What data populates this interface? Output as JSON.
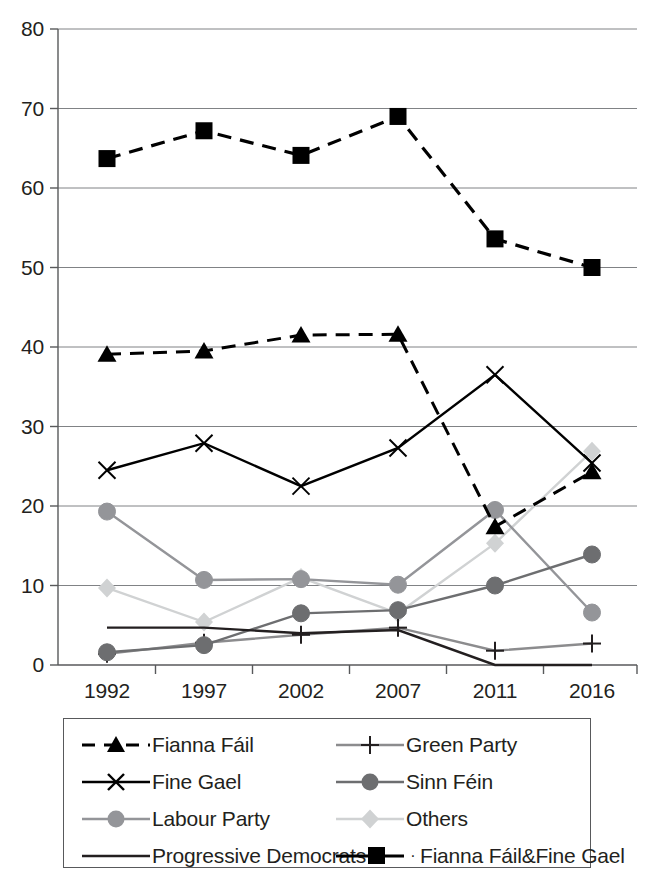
{
  "chart_data": {
    "type": "line",
    "title": "",
    "xlabel": "",
    "ylabel": "",
    "categories": [
      "1992",
      "1997",
      "2002",
      "2007",
      "2011",
      "2016"
    ],
    "ylim": [
      0,
      80
    ],
    "yticks": [
      0,
      10,
      20,
      30,
      40,
      50,
      60,
      70,
      80
    ],
    "grid": true,
    "legend_position": "bottom",
    "series": [
      {
        "name": "Fianna Fáil",
        "marker": "triangle",
        "line_style": "dashed",
        "color": "#000000",
        "values": [
          39.1,
          39.5,
          41.5,
          41.6,
          17.4,
          24.3
        ]
      },
      {
        "name": "Fine Gael",
        "marker": "cross-x",
        "line_style": "solid",
        "color": "#000000",
        "values": [
          24.5,
          27.9,
          22.5,
          27.3,
          36.5,
          25.4
        ]
      },
      {
        "name": "Labour Party",
        "marker": "circle",
        "line_style": "solid",
        "color": "#949599",
        "values": [
          19.3,
          10.7,
          10.8,
          10.1,
          19.5,
          6.6
        ]
      },
      {
        "name": "Progressive Democrats",
        "marker": "none",
        "line_style": "solid",
        "color": "#231f20",
        "values": [
          4.7,
          4.7,
          4.0,
          4.4,
          0.0,
          0.0
        ]
      },
      {
        "name": "Green Party",
        "marker": "plus",
        "line_style": "solid",
        "color": "#8c8c8e",
        "values": [
          1.4,
          2.8,
          3.8,
          4.7,
          1.8,
          2.7
        ]
      },
      {
        "name": "Sinn Féin",
        "marker": "circle",
        "line_style": "solid",
        "color": "#6d6e70",
        "values": [
          1.6,
          2.5,
          6.5,
          6.9,
          10.0,
          13.9
        ]
      },
      {
        "name": "Others",
        "marker": "diamond",
        "line_style": "solid",
        "color": "#d0d2d3",
        "values": [
          9.7,
          5.4,
          11.0,
          6.5,
          15.3,
          26.9
        ]
      },
      {
        "name": "Fianna Fáil&Fine Gael",
        "marker": "square",
        "line_style": "dashed",
        "color": "#000000",
        "values": [
          63.7,
          67.2,
          64.1,
          69.0,
          53.6,
          50.0
        ]
      }
    ]
  },
  "legend": {
    "items": [
      {
        "label": "Fianna Fáil",
        "key": "dashed-triangle-key",
        "dot": ""
      },
      {
        "label": "Green Party",
        "key": "solid-plus-key",
        "dot": ""
      },
      {
        "label": "Fine Gael",
        "key": "solid-cross-key",
        "dot": ""
      },
      {
        "label": "Sinn Féin",
        "key": "solid-circle-key",
        "dot": ""
      },
      {
        "label": "Labour Party",
        "key": "solid-circle-key",
        "dot": ""
      },
      {
        "label": "Others",
        "key": "solid-diamond-key",
        "dot": ""
      },
      {
        "label": "Progressive Democrats",
        "key": "solid-plain-key",
        "dot": ""
      },
      {
        "label": "Fianna Fáil&Fine Gael",
        "key": "solid-square-key",
        "dot": "·"
      }
    ]
  }
}
